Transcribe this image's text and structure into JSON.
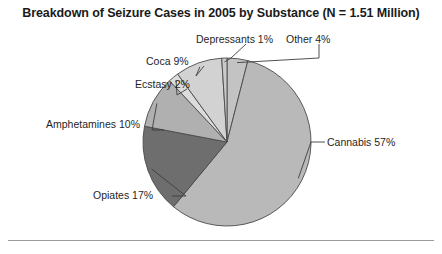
{
  "chart_data": {
    "type": "pie",
    "title": "Breakdown of Seizure Cases in 2005 by Substance (N = 1.51 Million)",
    "xlabel": "",
    "ylabel": "",
    "total_label": "N = 1.51 Million",
    "total_value": 1.51,
    "total_units": "Million",
    "year": 2005,
    "legend": "none",
    "grid": false,
    "value_units": "percent",
    "start_angle_deg": 0,
    "direction": "clockwise",
    "categories": [
      "Other",
      "Cannabis",
      "Opiates",
      "Amphetamines",
      "Ecstasy",
      "Coca",
      "Depressants"
    ],
    "values": [
      4,
      57,
      17,
      10,
      2,
      9,
      1
    ],
    "labels": [
      "Other 4%",
      "Cannabis 57%",
      "Opiates 17%",
      "Amphetamines 10%",
      "Ecstasy 2%",
      "Coca 9%",
      "Depressants 1%"
    ],
    "colors": [
      "#c3c3c3",
      "#b9b9b9",
      "#6e6e6e",
      "#b0b0b0",
      "#dcdcdc",
      "#d2d2d2",
      "#cacaca"
    ],
    "slices": [
      {
        "name": "Other",
        "value": 4,
        "label": "Other 4%",
        "color": "#c3c3c3"
      },
      {
        "name": "Cannabis",
        "value": 57,
        "label": "Cannabis 57%",
        "color": "#b9b9b9"
      },
      {
        "name": "Opiates",
        "value": 17,
        "label": "Opiates 17%",
        "color": "#6e6e6e"
      },
      {
        "name": "Amphetamines",
        "value": 10,
        "label": "Amphetamines 10%",
        "color": "#b0b0b0"
      },
      {
        "name": "Ecstasy",
        "value": 2,
        "label": "Ecstasy 2%",
        "color": "#dcdcdc"
      },
      {
        "name": "Coca",
        "value": 9,
        "label": "Coca 9%",
        "color": "#d2d2d2"
      },
      {
        "name": "Depressants",
        "value": 1,
        "label": "Depressants 1%",
        "color": "#cacaca"
      }
    ]
  },
  "figure": {
    "title": "Breakdown of Seizure Cases in 2005 by Substance (N = 1.51 Million)"
  }
}
